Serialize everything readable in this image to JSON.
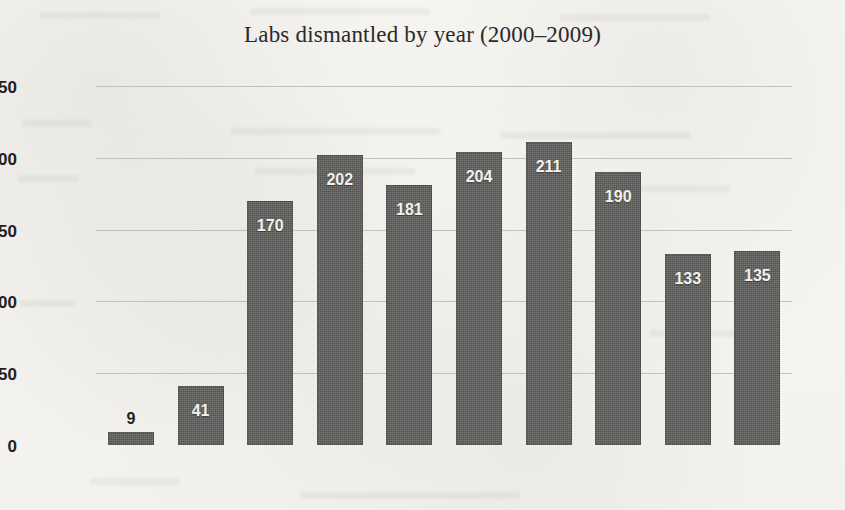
{
  "chart_data": {
    "type": "bar",
    "title": "Labs dismantled by year (2000–2009)",
    "xlabel": "",
    "ylabel": "",
    "categories": [
      "2000",
      "2001",
      "2002",
      "2003",
      "2004",
      "2005",
      "2006",
      "2007",
      "2008",
      "2009"
    ],
    "values": [
      9,
      41,
      170,
      202,
      181,
      204,
      211,
      190,
      133,
      135
    ],
    "value_labels": [
      "9",
      "41",
      "170",
      "202",
      "181",
      "204",
      "211",
      "190",
      "133",
      "135"
    ],
    "value_label_position": [
      "outside",
      "inside",
      "inside",
      "inside",
      "inside",
      "inside",
      "inside",
      "inside",
      "inside",
      "inside"
    ],
    "ylim": [
      0,
      250
    ],
    "yticks": [
      0,
      50,
      100,
      150,
      200,
      250
    ],
    "ytick_labels": [
      "0",
      "50",
      "100",
      "150",
      "200",
      "250"
    ],
    "grid": true,
    "legend": false,
    "bar_color": "#5e5e5c",
    "background_color": "#f7f6f3",
    "axis_color": "#4a4a48",
    "gridline_color": "#787874",
    "label_color_inside": "#f2f1ee",
    "label_color_outside": "#232221"
  }
}
